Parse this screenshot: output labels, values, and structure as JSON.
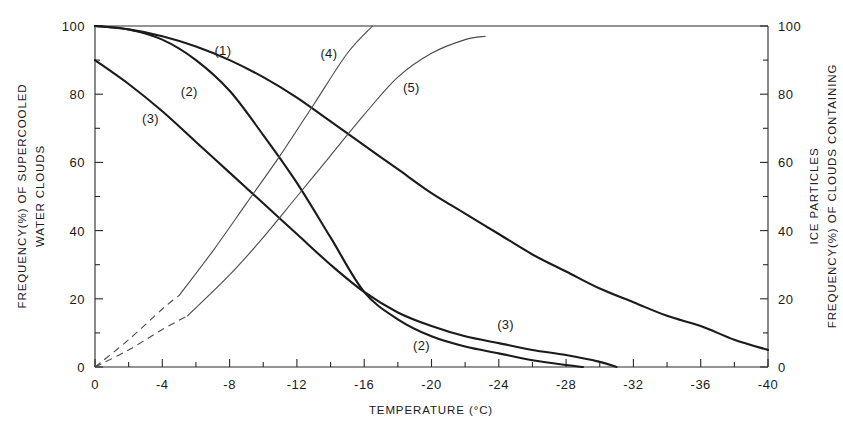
{
  "chart_data": {
    "type": "line",
    "title": "",
    "xlabel": "TEMPERATURE  (°C)",
    "ylabel": "FREQUENCY(%) OF SUPERCOOLED WATER CLOUDS",
    "ylabel_right": "FREQUENCY(%) OF CLOUDS CONTAINING ICE PARTICLES",
    "xlim": [
      0,
      -40
    ],
    "ylim": [
      0,
      100
    ],
    "ylim_right": [
      0,
      100
    ],
    "grid": false,
    "legend_position": "inline-curve-labels",
    "x_ticks": [
      0,
      -4,
      -8,
      -12,
      -16,
      -20,
      -24,
      -28,
      -32,
      -36,
      -40
    ],
    "x_tick_labels": [
      "0",
      "-4",
      "-8",
      "-12",
      "-16",
      "-20",
      "-24",
      "-28",
      "-32",
      "-36",
      "-40"
    ],
    "x_minor_tick_step": 2,
    "y_ticks": [
      0,
      20,
      40,
      60,
      80,
      100
    ],
    "y_tick_labels": [
      "0",
      "20",
      "40",
      "60",
      "80",
      "100"
    ],
    "y_minor_tick_step": 10,
    "y_ticks_right": [
      0,
      20,
      40,
      60,
      80,
      100
    ],
    "y_tick_labels_right": [
      "0",
      "20",
      "40",
      "60",
      "80",
      "100"
    ],
    "series": [
      {
        "name": "(1)",
        "label": "(1)",
        "axis": "left",
        "style": "solid-thick",
        "label_position": {
          "x": -7.6,
          "y": 93
        },
        "x": [
          0,
          -2,
          -4,
          -6,
          -8,
          -10,
          -12,
          -14,
          -16,
          -18,
          -20,
          -22,
          -24,
          -26,
          -28,
          -30,
          -32,
          -34,
          -36,
          -38,
          -40
        ],
        "y": [
          100,
          99,
          97,
          94,
          90,
          85,
          79,
          72,
          65,
          58,
          51,
          45,
          39,
          33,
          28,
          23,
          19,
          15,
          12,
          8,
          5
        ]
      },
      {
        "name": "(2)-upper",
        "label": "(2)",
        "axis": "left",
        "style": "solid-thick",
        "label_position": {
          "x": -5.6,
          "y": 81
        },
        "x": [
          0,
          -2,
          -4,
          -6,
          -8,
          -10,
          -12,
          -14,
          -16,
          -18,
          -20,
          -22,
          -24,
          -26,
          -28,
          -29
        ],
        "y": [
          100,
          99,
          96,
          90,
          81,
          68,
          54,
          38,
          22,
          14,
          9,
          6,
          4,
          2,
          0.6,
          0
        ]
      },
      {
        "name": "(3)-upper",
        "label": "(3)",
        "axis": "left",
        "style": "solid-thick",
        "label_position": {
          "x": -3.3,
          "y": 73
        },
        "x": [
          0,
          -2,
          -4,
          -6,
          -8,
          -10,
          -12,
          -14,
          -16,
          -18,
          -20,
          -22,
          -24,
          -26,
          -28,
          -30,
          -31
        ],
        "y": [
          90,
          83,
          75,
          66,
          57,
          48,
          39,
          30,
          22,
          16,
          12,
          9,
          7,
          5,
          3.5,
          1.5,
          0
        ]
      },
      {
        "name": "(2)-label-lower",
        "label": "(2)",
        "axis": "left",
        "style": "label-only",
        "label_position": {
          "x": -19.4,
          "y": 6.5
        }
      },
      {
        "name": "(3)-label-lower",
        "label": "(3)",
        "axis": "left",
        "style": "label-only",
        "label_position": {
          "x": -24.4,
          "y": 12.5
        }
      },
      {
        "name": "(4)",
        "label": "(4)",
        "axis": "right",
        "style": "solid-thin-with-dashed-origin",
        "label_position": {
          "x": -13.9,
          "y": 92
        },
        "dashed_x": [
          0,
          -2,
          -4,
          -5
        ],
        "dashed_y": [
          0,
          8,
          17,
          21
        ],
        "x": [
          -5,
          -7,
          -9,
          -11,
          -13,
          -15,
          -16.5
        ],
        "y": [
          21,
          34,
          48,
          62,
          77,
          92,
          100
        ]
      },
      {
        "name": "(5)",
        "label": "(5)",
        "axis": "right",
        "style": "solid-thin-with-dashed-origin",
        "label_position": {
          "x": -18.8,
          "y": 82
        },
        "dashed_x": [
          0,
          -2,
          -4,
          -5.5
        ],
        "dashed_y": [
          0,
          5,
          11,
          15
        ],
        "x": [
          -5.5,
          -8,
          -10,
          -12,
          -14,
          -16,
          -18,
          -20,
          -22,
          -23.2
        ],
        "y": [
          15,
          27,
          38,
          50,
          62,
          74,
          85,
          92,
          96,
          97
        ]
      }
    ]
  }
}
